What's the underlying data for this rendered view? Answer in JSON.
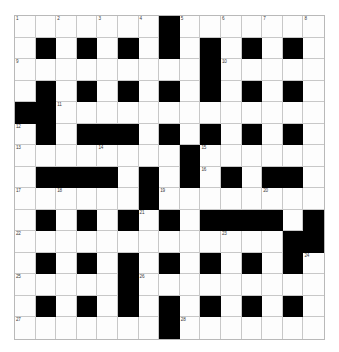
{
  "puzzle": {
    "type": "crossword-grid",
    "title": "",
    "rows": 15,
    "columns": 15,
    "colors": {
      "block": "#000000",
      "cell": "#fdfdfd",
      "grid_line": "#c8c8c8",
      "frame": "#b9b9b9",
      "number_text": "#3a3a3a",
      "page_background": "#ffffff"
    },
    "legend": {
      "0": "open/white cell",
      "1": "blocked/black cell"
    },
    "grid": [
      [
        0,
        0,
        0,
        0,
        0,
        0,
        0,
        1,
        0,
        0,
        0,
        0,
        0,
        0,
        0
      ],
      [
        0,
        1,
        0,
        1,
        0,
        1,
        0,
        1,
        0,
        1,
        0,
        1,
        0,
        1,
        0
      ],
      [
        0,
        0,
        0,
        0,
        0,
        0,
        0,
        0,
        0,
        1,
        0,
        0,
        0,
        0,
        0
      ],
      [
        0,
        1,
        0,
        1,
        0,
        1,
        0,
        1,
        0,
        1,
        0,
        1,
        0,
        1,
        0
      ],
      [
        1,
        1,
        0,
        0,
        0,
        0,
        0,
        0,
        0,
        0,
        0,
        0,
        0,
        0,
        0
      ],
      [
        0,
        1,
        0,
        1,
        1,
        1,
        0,
        1,
        0,
        1,
        0,
        1,
        0,
        1,
        0
      ],
      [
        0,
        0,
        0,
        0,
        0,
        0,
        0,
        0,
        1,
        0,
        0,
        0,
        0,
        0,
        0
      ],
      [
        0,
        1,
        1,
        1,
        1,
        0,
        1,
        0,
        1,
        0,
        1,
        0,
        1,
        1,
        0
      ],
      [
        0,
        0,
        0,
        0,
        0,
        0,
        1,
        0,
        0,
        0,
        0,
        0,
        0,
        0,
        0
      ],
      [
        0,
        1,
        0,
        1,
        0,
        1,
        0,
        1,
        0,
        1,
        1,
        1,
        1,
        0,
        1
      ],
      [
        0,
        0,
        0,
        0,
        0,
        0,
        0,
        0,
        0,
        0,
        0,
        0,
        0,
        1,
        1
      ],
      [
        0,
        1,
        0,
        1,
        0,
        1,
        0,
        1,
        0,
        1,
        0,
        1,
        0,
        1,
        0
      ],
      [
        0,
        0,
        0,
        0,
        0,
        1,
        0,
        0,
        0,
        0,
        0,
        0,
        0,
        0,
        0
      ],
      [
        0,
        1,
        0,
        1,
        0,
        1,
        0,
        1,
        0,
        1,
        0,
        1,
        0,
        1,
        0
      ],
      [
        0,
        0,
        0,
        0,
        0,
        0,
        0,
        1,
        0,
        0,
        0,
        0,
        0,
        0,
        0
      ]
    ],
    "numbers": [
      {
        "number": "1",
        "row": 1,
        "col": 1
      },
      {
        "number": "2",
        "row": 1,
        "col": 3
      },
      {
        "number": "3",
        "row": 1,
        "col": 5
      },
      {
        "number": "4",
        "row": 1,
        "col": 7
      },
      {
        "number": "5",
        "row": 1,
        "col": 9
      },
      {
        "number": "6",
        "row": 1,
        "col": 11
      },
      {
        "number": "7",
        "row": 1,
        "col": 13
      },
      {
        "number": "8",
        "row": 1,
        "col": 15
      },
      {
        "number": "9",
        "row": 3,
        "col": 1
      },
      {
        "number": "10",
        "row": 3,
        "col": 11
      },
      {
        "number": "11",
        "row": 5,
        "col": 3
      },
      {
        "number": "12",
        "row": 6,
        "col": 1
      },
      {
        "number": "13",
        "row": 7,
        "col": 1
      },
      {
        "number": "14",
        "row": 7,
        "col": 5
      },
      {
        "number": "15",
        "row": 7,
        "col": 10
      },
      {
        "number": "16",
        "row": 8,
        "col": 10
      },
      {
        "number": "17",
        "row": 9,
        "col": 1
      },
      {
        "number": "18",
        "row": 9,
        "col": 3
      },
      {
        "number": "19",
        "row": 9,
        "col": 8
      },
      {
        "number": "20",
        "row": 9,
        "col": 13
      },
      {
        "number": "21",
        "row": 10,
        "col": 7
      },
      {
        "number": "22",
        "row": 11,
        "col": 1
      },
      {
        "number": "23",
        "row": 11,
        "col": 11
      },
      {
        "number": "24",
        "row": 12,
        "col": 15
      },
      {
        "number": "25",
        "row": 13,
        "col": 1
      },
      {
        "number": "26",
        "row": 13,
        "col": 7
      },
      {
        "number": "27",
        "row": 15,
        "col": 1
      },
      {
        "number": "28",
        "row": 15,
        "col": 9
      }
    ]
  }
}
